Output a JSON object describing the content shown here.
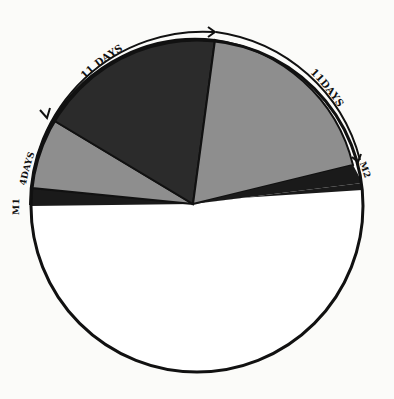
{
  "diagram": {
    "type": "pie-style cycle diagram",
    "colors": {
      "background": "#fbfbf9",
      "outline": "#111111",
      "dark_segment": "#2b2b2b",
      "grey_segment": "#8e8e8e",
      "band": "#1a1a1a",
      "empty": "#ffffff"
    },
    "segments": [
      {
        "name": "band-m1",
        "label": "",
        "shade": "band"
      },
      {
        "name": "segment-4-days",
        "label": "4 DAYS",
        "shade": "grey"
      },
      {
        "name": "segment-11-days-dark",
        "label": "11 DAYS",
        "shade": "dark"
      },
      {
        "name": "segment-11-days-grey",
        "label": "11 DAYS",
        "shade": "grey"
      },
      {
        "name": "band-m2",
        "label": "",
        "shade": "band"
      },
      {
        "name": "remainder",
        "label": "",
        "shade": "empty"
      }
    ],
    "labels": {
      "m1": "M1",
      "m2": "M2",
      "days_4": "4DAYS",
      "days_11_left": "11 DAYS",
      "days_11_right": "11DAYS"
    }
  }
}
